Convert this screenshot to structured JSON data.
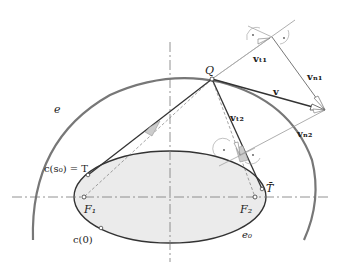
{
  "diagram": {
    "labels": {
      "Q": "Q",
      "e": "e",
      "e0": "e₀",
      "F1": "F₁",
      "F2": "F₂",
      "T_bar": "T̄",
      "c_s0": "c(s₀) = T",
      "c_0": "c(0)",
      "v": "v",
      "v_t1": "vₜ₁",
      "v_n1": "vₙ₁",
      "v_t2": "vₜ₂",
      "v_n2": "vₙ₂"
    },
    "colors": {
      "ellipse_fill": "#ebebeb",
      "curve": "#333333",
      "outer_arc": "#666666",
      "construction": "#999999",
      "axis": "#777777"
    },
    "points": {
      "Q": [
        212,
        79
      ],
      "F1": [
        84,
        197
      ],
      "F2": [
        255,
        197
      ],
      "T": [
        88,
        175
      ],
      "T_bar": [
        262,
        189
      ],
      "c0": [
        101,
        228
      ],
      "v_tip": [
        325,
        110
      ]
    }
  }
}
